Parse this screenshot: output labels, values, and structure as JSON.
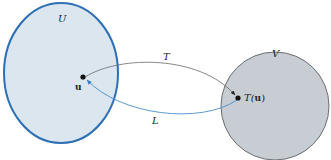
{
  "diagram": {
    "sets": [
      {
        "id": "U",
        "label": "U",
        "fill": "#dbe6ef",
        "stroke": "#2f6fb3"
      },
      {
        "id": "V",
        "label": "V",
        "fill": "#c8cdd3",
        "stroke": "#6b6f74"
      }
    ],
    "points": [
      {
        "id": "u",
        "label": "u",
        "set": "U"
      },
      {
        "id": "Tu",
        "label_prefix": "T(",
        "label_bold": "u",
        "label_suffix": ")",
        "set": "V"
      }
    ],
    "arrows": [
      {
        "id": "T",
        "label": "T",
        "from": "u",
        "to": "Tu",
        "color": "#555a60"
      },
      {
        "id": "L",
        "label": "L",
        "from": "Tu",
        "to": "u",
        "color": "#4a8fd0"
      }
    ]
  }
}
